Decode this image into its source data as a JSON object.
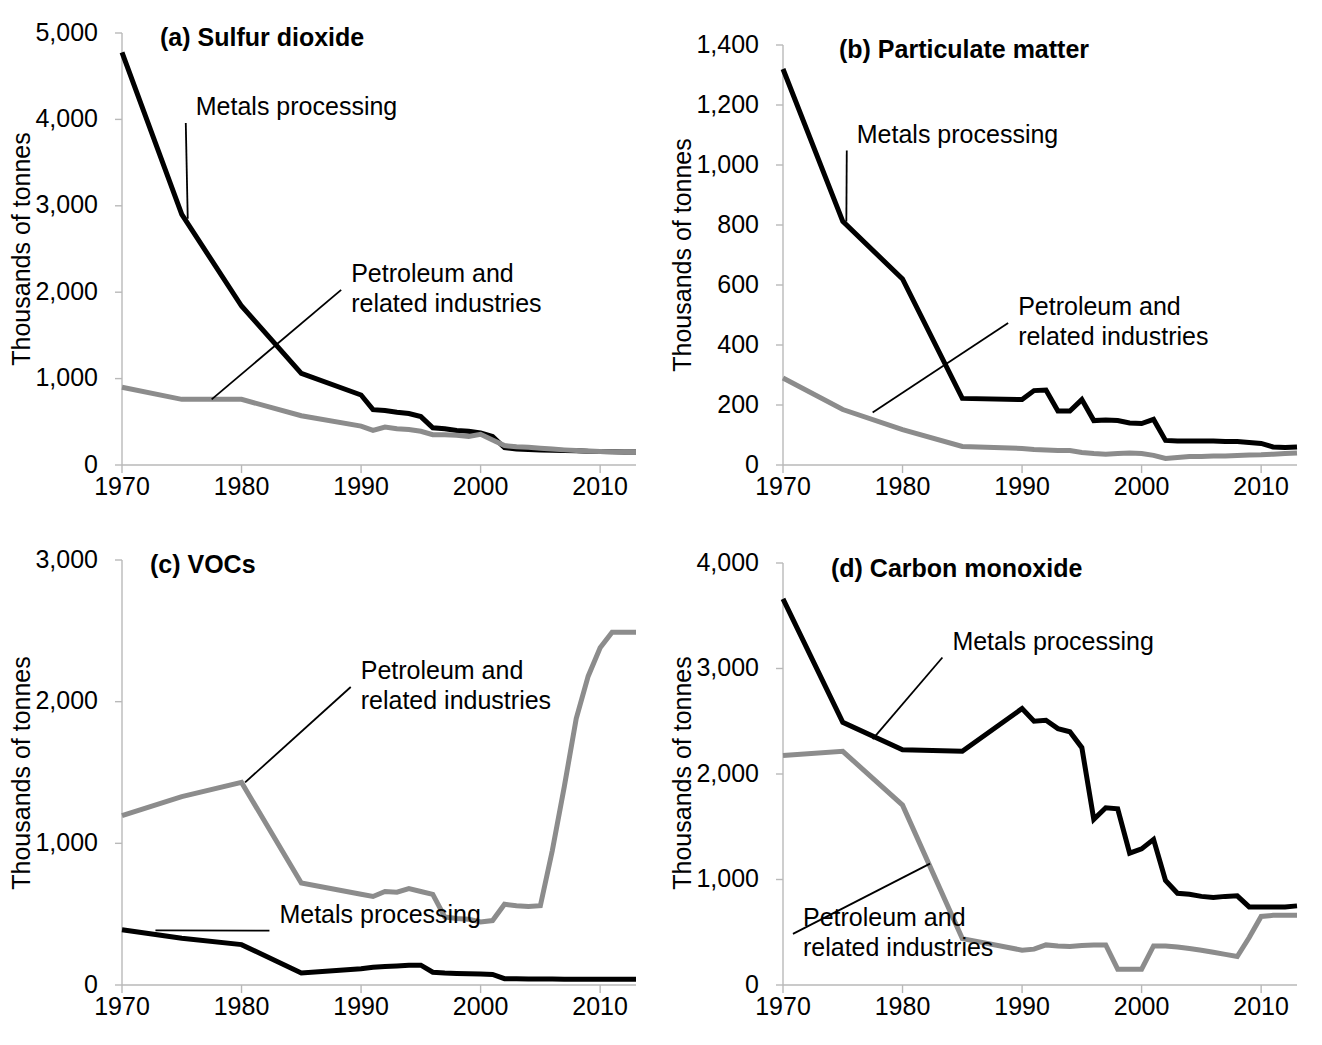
{
  "figure": {
    "panel_count": 4,
    "shared_ylabel": "Thousands of tonnes",
    "series_names": [
      "Metals processing",
      "Petroleum and related industries"
    ],
    "series_colors": {
      "metals": "#000000",
      "petroleum": "#8c8c8c"
    },
    "axis_color": "#b9b9b9"
  },
  "chart_data": [
    {
      "id": "a",
      "type": "line",
      "title": "(a) Sulfur dioxide",
      "xlabel": "",
      "ylabel": "Thousands of tonnes",
      "xlim": [
        1970,
        2013
      ],
      "ylim": [
        0,
        5000
      ],
      "yticks": [
        0,
        1000,
        2000,
        3000,
        4000,
        5000
      ],
      "ytick_labels": [
        "0",
        "1,000",
        "2,000",
        "3,000",
        "4,000",
        "5,000"
      ],
      "xticks": [
        1970,
        1980,
        1990,
        2000,
        2010
      ],
      "xtick_labels": [
        "1970",
        "1980",
        "1990",
        "2000",
        "2010"
      ],
      "grid": false,
      "legend": "annotations",
      "annotations": [
        {
          "text_lines": [
            "Metals processing"
          ],
          "text_x": 1975.0,
          "text_y": 4050,
          "anchor_x": 1975.5,
          "anchor_y": 2850
        },
        {
          "text_lines": [
            "Petroleum and",
            "related industries"
          ],
          "text_x": 1988.0,
          "text_y": 2120,
          "anchor_x": 1977.5,
          "anchor_y": 760
        }
      ],
      "series": [
        {
          "name": "Metals processing",
          "color": "#000000",
          "x": [
            1970,
            1975,
            1980,
            1985,
            1990,
            1991,
            1992,
            1993,
            1994,
            1995,
            1996,
            1997,
            1998,
            1999,
            2000,
            2001,
            2002,
            2003,
            2004,
            2005,
            2006,
            2007,
            2008,
            2009,
            2010,
            2011,
            2012,
            2013
          ],
          "values": [
            4775,
            2900,
            1840,
            1060,
            810,
            640,
            630,
            610,
            595,
            560,
            430,
            420,
            400,
            390,
            370,
            330,
            200,
            185,
            180,
            175,
            170,
            168,
            165,
            160,
            155,
            152,
            150,
            150
          ]
        },
        {
          "name": "Petroleum and related industries",
          "color": "#8c8c8c",
          "x": [
            1970,
            1975,
            1980,
            1985,
            1990,
            1991,
            1992,
            1993,
            1994,
            1995,
            1996,
            1997,
            1998,
            1999,
            2000,
            2001,
            2002,
            2003,
            2004,
            2005,
            2006,
            2007,
            2008,
            2009,
            2010,
            2011,
            2012,
            2013
          ],
          "values": [
            900,
            760,
            760,
            570,
            450,
            400,
            440,
            420,
            410,
            390,
            350,
            350,
            345,
            330,
            355,
            290,
            225,
            210,
            205,
            195,
            185,
            175,
            168,
            160,
            155,
            152,
            150,
            148
          ]
        }
      ]
    },
    {
      "id": "b",
      "type": "line",
      "title": "(b) Particulate matter",
      "xlabel": "",
      "ylabel": "Thousands of tonnes",
      "xlim": [
        1970,
        2013
      ],
      "ylim": [
        0,
        1400
      ],
      "yticks": [
        0,
        200,
        400,
        600,
        800,
        1000,
        1200,
        1400
      ],
      "ytick_labels": [
        "0",
        "200",
        "400",
        "600",
        "800",
        "1,000",
        "1,200",
        "1,400"
      ],
      "xticks": [
        1970,
        1980,
        1990,
        2000,
        2010
      ],
      "xtick_labels": [
        "1970",
        "1980",
        "1990",
        "2000",
        "2010"
      ],
      "grid": false,
      "legend": "annotations",
      "annotations": [
        {
          "text_lines": [
            "Metals processing"
          ],
          "text_x": 1975.0,
          "text_y": 1075,
          "anchor_x": 1975.3,
          "anchor_y": 812
        },
        {
          "text_lines": [
            "Petroleum and",
            "related industries"
          ],
          "text_x": 1988.5,
          "text_y": 500,
          "anchor_x": 1977.5,
          "anchor_y": 175
        }
      ],
      "series": [
        {
          "name": "Metals processing",
          "color": "#000000",
          "x": [
            1970,
            1975,
            1980,
            1985,
            1990,
            1991,
            1992,
            1993,
            1994,
            1995,
            1996,
            1997,
            1998,
            1999,
            2000,
            2001,
            2002,
            2003,
            2004,
            2005,
            2006,
            2007,
            2008,
            2009,
            2010,
            2011,
            2012,
            2013
          ],
          "values": [
            1320,
            812,
            620,
            222,
            218,
            248,
            250,
            180,
            180,
            218,
            148,
            150,
            148,
            140,
            138,
            152,
            82,
            80,
            80,
            80,
            80,
            78,
            78,
            75,
            72,
            60,
            58,
            60
          ]
        },
        {
          "name": "Petroleum and related industries",
          "color": "#8c8c8c",
          "x": [
            1970,
            1975,
            1980,
            1985,
            1990,
            1991,
            1992,
            1993,
            1994,
            1995,
            1996,
            1997,
            1998,
            1999,
            2000,
            2001,
            2002,
            2003,
            2004,
            2005,
            2006,
            2007,
            2008,
            2009,
            2010,
            2011,
            2012,
            2013
          ],
          "values": [
            290,
            185,
            118,
            62,
            55,
            52,
            50,
            48,
            48,
            42,
            38,
            36,
            38,
            40,
            38,
            32,
            22,
            25,
            28,
            28,
            30,
            30,
            32,
            33,
            34,
            36,
            38,
            40
          ]
        }
      ]
    },
    {
      "id": "c",
      "type": "line",
      "title": "(c) VOCs",
      "xlabel": "",
      "ylabel": "Thousands of tonnes",
      "xlim": [
        1970,
        2013
      ],
      "ylim": [
        0,
        3000
      ],
      "yticks": [
        0,
        1000,
        2000,
        3000
      ],
      "ytick_labels": [
        "0",
        "1,000",
        "2,000",
        "3,000"
      ],
      "xticks": [
        1970,
        1980,
        1990,
        2000,
        2010
      ],
      "xtick_labels": [
        "1970",
        "1980",
        "1990",
        "2000",
        "2010"
      ],
      "grid": false,
      "legend": "annotations",
      "annotations": [
        {
          "text_lines": [
            "Petroleum and",
            "related industries"
          ],
          "text_x": 1988.8,
          "text_y": 2160,
          "anchor_x": 1980.3,
          "anchor_y": 1430
        },
        {
          "text_lines": [
            "Metals processing"
          ],
          "text_x": 1982.0,
          "text_y": 440,
          "anchor_x": 1972.8,
          "anchor_y": 385
        }
      ],
      "series": [
        {
          "name": "Petroleum and related industries",
          "color": "#8c8c8c",
          "x": [
            1970,
            1975,
            1980,
            1985,
            1990,
            1991,
            1992,
            1993,
            1994,
            1995,
            1996,
            1997,
            1998,
            1999,
            2000,
            2001,
            2002,
            2003,
            2004,
            2005,
            2006,
            2007,
            2008,
            2009,
            2010,
            2011,
            2012,
            2013
          ],
          "values": [
            1195,
            1330,
            1430,
            720,
            640,
            625,
            660,
            655,
            680,
            660,
            640,
            480,
            470,
            465,
            445,
            455,
            570,
            560,
            555,
            560,
            950,
            1400,
            1880,
            2180,
            2380,
            2490,
            2490,
            2490
          ]
        },
        {
          "name": "Metals processing",
          "color": "#000000",
          "x": [
            1970,
            1975,
            1980,
            1985,
            1990,
            1991,
            1992,
            1993,
            1994,
            1995,
            1996,
            1997,
            1998,
            1999,
            2000,
            2001,
            2002,
            2003,
            2004,
            2005,
            2006,
            2007,
            2008,
            2009,
            2010,
            2011,
            2012,
            2013
          ],
          "values": [
            390,
            330,
            285,
            85,
            115,
            125,
            130,
            135,
            140,
            140,
            90,
            85,
            82,
            80,
            78,
            75,
            45,
            45,
            43,
            42,
            42,
            40,
            40,
            40,
            40,
            40,
            40,
            40
          ]
        }
      ]
    },
    {
      "id": "d",
      "type": "line",
      "title": "(d) Carbon monoxide",
      "xlabel": "",
      "ylabel": "Thousands of tonnes",
      "xlim": [
        1970,
        2013
      ],
      "ylim": [
        0,
        4000
      ],
      "yticks": [
        0,
        1000,
        2000,
        3000,
        4000
      ],
      "ytick_labels": [
        "0",
        "1,000",
        "2,000",
        "3,000",
        "4,000"
      ],
      "xticks": [
        1970,
        1980,
        1990,
        2000,
        2010
      ],
      "xtick_labels": [
        "1970",
        "1980",
        "1990",
        "2000",
        "2010"
      ],
      "grid": false,
      "legend": "annotations",
      "annotations": [
        {
          "text_lines": [
            "Metals processing"
          ],
          "text_x": 1983.0,
          "text_y": 3180,
          "anchor_x": 1977.5,
          "anchor_y": 2330
        },
        {
          "text_lines": [
            "Petroleum and",
            "related industries"
          ],
          "text_x": 1970.5,
          "text_y": 560,
          "anchor_x": 1982.3,
          "anchor_y": 1150
        }
      ],
      "series": [
        {
          "name": "Metals processing",
          "color": "#000000",
          "x": [
            1970,
            1975,
            1980,
            1985,
            1990,
            1991,
            1992,
            1993,
            1994,
            1995,
            1996,
            1997,
            1998,
            1999,
            2000,
            2001,
            2002,
            2003,
            2004,
            2005,
            2006,
            2007,
            2008,
            2009,
            2010,
            2011,
            2012,
            2013
          ],
          "values": [
            3660,
            2490,
            2230,
            2215,
            2620,
            2500,
            2510,
            2430,
            2400,
            2250,
            1570,
            1680,
            1670,
            1250,
            1290,
            1380,
            990,
            870,
            860,
            840,
            830,
            840,
            845,
            740,
            740,
            740,
            740,
            750
          ]
        },
        {
          "name": "Petroleum and related industries",
          "color": "#8c8c8c",
          "x": [
            1970,
            1975,
            1980,
            1985,
            1990,
            1991,
            1992,
            1993,
            1994,
            1995,
            1996,
            1997,
            1998,
            1999,
            2000,
            2001,
            2002,
            2003,
            2004,
            2005,
            2006,
            2007,
            2008,
            2009,
            2010,
            2011,
            2012,
            2013
          ],
          "values": [
            2175,
            2215,
            1705,
            440,
            330,
            340,
            380,
            370,
            365,
            375,
            380,
            380,
            150,
            150,
            150,
            370,
            370,
            360,
            345,
            330,
            310,
            290,
            270,
            450,
            650,
            660,
            660,
            660
          ]
        }
      ]
    }
  ]
}
